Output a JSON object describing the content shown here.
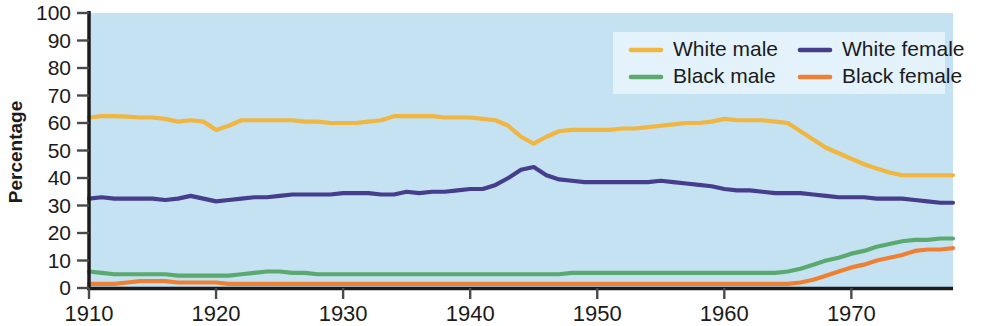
{
  "chart_data": {
    "type": "line",
    "title": "",
    "xlabel": "",
    "ylabel": "Percentage",
    "xlim": [
      1910,
      1978
    ],
    "ylim": [
      0,
      100
    ],
    "grid": false,
    "legend_position": "top-right",
    "x_ticks": [
      "1910",
      "1920",
      "1930",
      "1940",
      "1950",
      "1960",
      "1970"
    ],
    "x_tick_values": [
      1910,
      1920,
      1930,
      1940,
      1950,
      1960,
      1970
    ],
    "y_ticks": [
      "0",
      "10",
      "20",
      "30",
      "40",
      "50",
      "60",
      "70",
      "80",
      "90",
      "100"
    ],
    "y_tick_values": [
      0,
      10,
      20,
      30,
      40,
      50,
      60,
      70,
      80,
      90,
      100
    ],
    "x": [
      1910,
      1911,
      1912,
      1913,
      1914,
      1915,
      1916,
      1917,
      1918,
      1919,
      1920,
      1921,
      1922,
      1923,
      1924,
      1925,
      1926,
      1927,
      1928,
      1929,
      1930,
      1931,
      1932,
      1933,
      1934,
      1935,
      1936,
      1937,
      1938,
      1939,
      1940,
      1941,
      1942,
      1943,
      1944,
      1945,
      1946,
      1947,
      1948,
      1949,
      1950,
      1951,
      1952,
      1953,
      1954,
      1955,
      1956,
      1957,
      1958,
      1959,
      1960,
      1961,
      1962,
      1963,
      1964,
      1965,
      1966,
      1967,
      1968,
      1969,
      1970,
      1971,
      1972,
      1973,
      1974,
      1975,
      1976,
      1977,
      1978
    ],
    "series": [
      {
        "name": "White male",
        "color": "#f0b63f",
        "values": [
          62,
          62.5,
          62.5,
          62.3,
          62,
          62,
          61.5,
          60.5,
          61,
          60.5,
          57.5,
          59,
          61,
          61,
          61,
          61,
          61,
          60.5,
          60.5,
          60,
          60,
          60,
          60.5,
          61,
          62.5,
          62.5,
          62.5,
          62.5,
          62,
          62,
          62,
          61.5,
          61,
          59,
          55,
          52.5,
          55,
          57,
          57.5,
          57.5,
          57.5,
          57.5,
          58,
          58,
          58.5,
          59,
          59.5,
          60,
          60,
          60.5,
          61.5,
          61,
          61,
          61,
          60.5,
          60,
          57,
          54,
          51,
          49,
          47,
          45,
          43.5,
          42,
          41,
          41,
          41,
          41,
          41
        ]
      },
      {
        "name": "White female",
        "color": "#463d8c",
        "values": [
          32.5,
          33,
          32.5,
          32.5,
          32.5,
          32.5,
          32,
          32.5,
          33.5,
          32.5,
          31.5,
          32,
          32.5,
          33,
          33,
          33.5,
          34,
          34,
          34,
          34,
          34.5,
          34.5,
          34.5,
          34,
          34,
          35,
          34.5,
          35,
          35,
          35.5,
          36,
          36,
          37.5,
          40,
          43,
          44,
          41,
          39.5,
          39,
          38.5,
          38.5,
          38.5,
          38.5,
          38.5,
          38.5,
          39,
          38.5,
          38,
          37.5,
          37,
          36,
          35.5,
          35.5,
          35,
          34.5,
          34.5,
          34.5,
          34,
          33.5,
          33,
          33,
          33,
          32.5,
          32.5,
          32.5,
          32,
          31.5,
          31,
          31
        ]
      },
      {
        "name": "Black male",
        "color": "#5aa96e",
        "values": [
          6,
          5.5,
          5,
          5,
          5,
          5,
          5,
          4.5,
          4.5,
          4.5,
          4.5,
          4.5,
          5,
          5.5,
          6,
          6,
          5.5,
          5.5,
          5,
          5,
          5,
          5,
          5,
          5,
          5,
          5,
          5,
          5,
          5,
          5,
          5,
          5,
          5,
          5,
          5,
          5,
          5,
          5,
          5.5,
          5.5,
          5.5,
          5.5,
          5.5,
          5.5,
          5.5,
          5.5,
          5.5,
          5.5,
          5.5,
          5.5,
          5.5,
          5.5,
          5.5,
          5.5,
          5.5,
          6,
          7,
          8.5,
          10,
          11,
          12.5,
          13.5,
          15,
          16,
          17,
          17.5,
          17.5,
          18,
          18
        ]
      },
      {
        "name": "Black female",
        "color": "#ef8033",
        "values": [
          1.5,
          1.5,
          1.5,
          2,
          2.5,
          2.5,
          2.5,
          2,
          2,
          2,
          2,
          1.5,
          1.5,
          1.5,
          1.5,
          1.5,
          1.5,
          1.5,
          1.5,
          1.5,
          1.5,
          1.5,
          1.5,
          1.5,
          1.5,
          1.5,
          1.5,
          1.5,
          1.5,
          1.5,
          1.5,
          1.5,
          1.5,
          1.5,
          1.5,
          1.5,
          1.5,
          1.5,
          1.5,
          1.5,
          1.5,
          1.5,
          1.5,
          1.5,
          1.5,
          1.5,
          1.5,
          1.5,
          1.5,
          1.5,
          1.5,
          1.5,
          1.5,
          1.5,
          1.5,
          1.5,
          2,
          3,
          4.5,
          6,
          7.5,
          8.5,
          10,
          11,
          12,
          13.5,
          14,
          14,
          14.5
        ]
      }
    ]
  },
  "legend": {
    "items": [
      {
        "label": "White male",
        "color": "#f0b63f"
      },
      {
        "label": "White female",
        "color": "#463d8c"
      },
      {
        "label": "Black male",
        "color": "#5aa96e"
      },
      {
        "label": "Black female",
        "color": "#ef8033"
      }
    ]
  },
  "style": {
    "plot_background": "#c5e2f2",
    "legend_background": "#e3f2fb",
    "axis_color": "#1b1b1b",
    "page_background": "#ffffff"
  }
}
